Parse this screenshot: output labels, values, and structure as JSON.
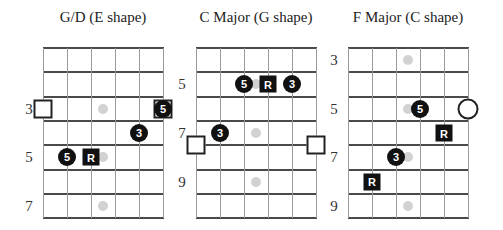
{
  "colors": {
    "note_fill": "#111111",
    "inlay": "#d2d2d2",
    "fret_line": "#4a4a4a",
    "string_line": "#9a9a9a"
  },
  "charts": [
    {
      "title": "G/D (E shape)",
      "fret_labels": [
        {
          "row": 3,
          "label": "3"
        },
        {
          "row": 5,
          "label": "5"
        },
        {
          "row": 7,
          "label": "7"
        }
      ],
      "inlays": [
        {
          "row": 3
        },
        {
          "row": 5
        },
        {
          "row": 7
        }
      ],
      "notes": [
        {
          "type": "dot",
          "label": "5",
          "line": 5,
          "row": 3
        },
        {
          "type": "dot",
          "label": "3",
          "line": 4,
          "row": 4
        },
        {
          "type": "dot",
          "label": "5",
          "line": 1,
          "row": 5
        },
        {
          "type": "root",
          "label": "R",
          "line": 2,
          "row": 5
        }
      ],
      "markers": [
        {
          "type": "square",
          "line": 0,
          "row": 3
        },
        {
          "type": "square",
          "line": 5,
          "row": 3
        }
      ]
    },
    {
      "title": "C Major (G shape)",
      "fret_labels": [
        {
          "row": 2,
          "label": "5"
        },
        {
          "row": 4,
          "label": "7"
        },
        {
          "row": 6,
          "label": "9"
        }
      ],
      "inlays": [
        {
          "row": 2
        },
        {
          "row": 4
        },
        {
          "row": 6
        }
      ],
      "notes": [
        {
          "type": "dot",
          "label": "5",
          "line": 2,
          "row": 2
        },
        {
          "type": "root",
          "label": "R",
          "line": 3,
          "row": 2
        },
        {
          "type": "dot",
          "label": "3",
          "line": 4,
          "row": 2
        },
        {
          "type": "dot",
          "label": "3",
          "line": 1,
          "row": 4
        }
      ],
      "markers": [
        {
          "type": "square",
          "line": 0,
          "row": 4.5
        },
        {
          "type": "square",
          "line": 5,
          "row": 4.5
        }
      ]
    },
    {
      "title": "F Major (C shape)",
      "fret_labels": [
        {
          "row": 1,
          "label": "3"
        },
        {
          "row": 3,
          "label": "5"
        },
        {
          "row": 5,
          "label": "7"
        },
        {
          "row": 7,
          "label": "9"
        }
      ],
      "inlays": [
        {
          "row": 1
        },
        {
          "row": 3
        },
        {
          "row": 5
        },
        {
          "row": 7
        }
      ],
      "notes": [
        {
          "type": "dot",
          "label": "5",
          "line": 3,
          "row": 3
        },
        {
          "type": "root",
          "label": "R",
          "line": 4,
          "row": 4
        },
        {
          "type": "dot",
          "label": "3",
          "line": 2,
          "row": 5
        },
        {
          "type": "root",
          "label": "R",
          "line": 1,
          "row": 6
        }
      ],
      "markers": [
        {
          "type": "circle",
          "line": 5,
          "row": 3
        }
      ]
    }
  ]
}
